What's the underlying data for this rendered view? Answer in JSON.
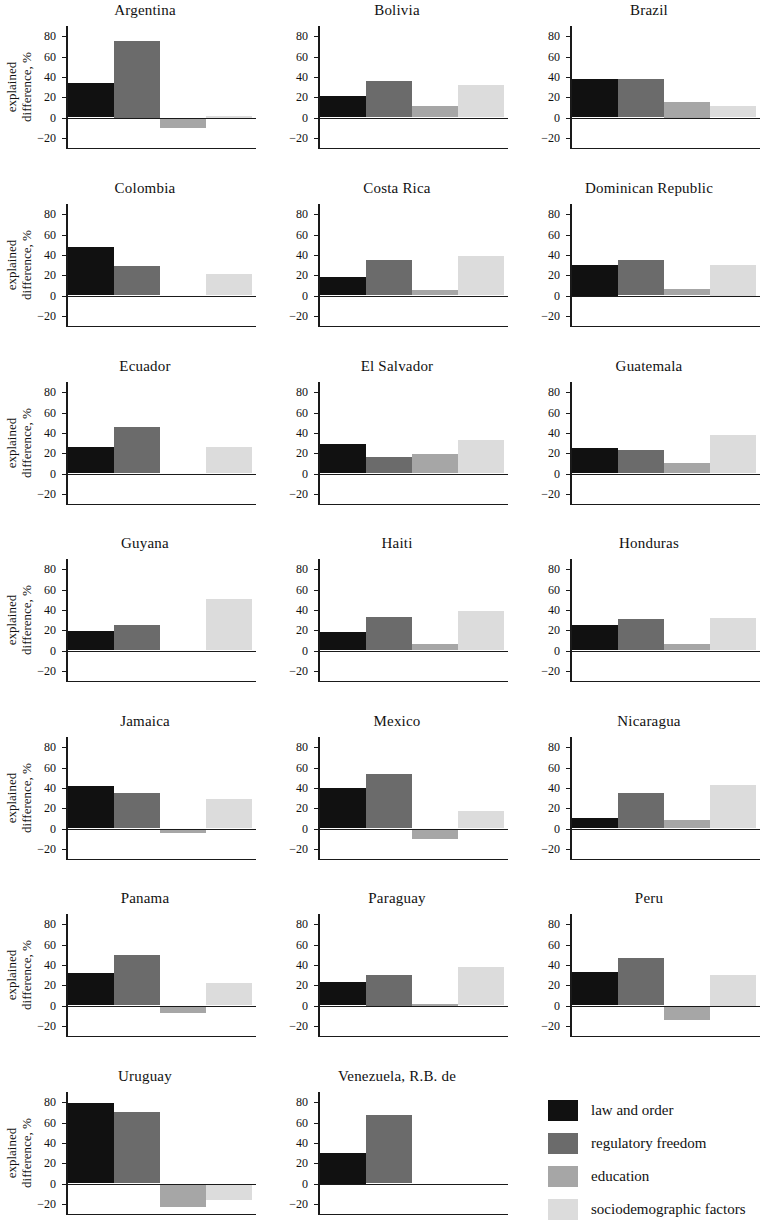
{
  "axis": {
    "ylabel_line1": "explained",
    "ylabel_line2": "difference, %",
    "ticks": [
      "80",
      "60",
      "40",
      "20",
      "0",
      "−20"
    ],
    "tick_values": [
      80,
      60,
      40,
      20,
      0,
      -20
    ],
    "ymin": -30,
    "ymax": 90
  },
  "legend": {
    "items": [
      {
        "label": "law and order",
        "color": "#111111"
      },
      {
        "label": "regulatory freedom",
        "color": "#6b6b6b"
      },
      {
        "label": "education",
        "color": "#a6a6a6"
      },
      {
        "label": "sociodemographic factors",
        "color": "#dcdcdc"
      }
    ]
  },
  "chart_data": {
    "type": "bar",
    "title": "",
    "xlabel": "",
    "ylabel": "explained difference, %",
    "ylim": [
      -30,
      90
    ],
    "yticks": [
      -20,
      0,
      20,
      40,
      60,
      80
    ],
    "grid": false,
    "legend_position": "bottom-right",
    "categories": [
      "law and order",
      "regulatory freedom",
      "education",
      "sociodemographic factors"
    ],
    "colors": [
      "#111111",
      "#6b6b6b",
      "#a6a6a6",
      "#dcdcdc"
    ],
    "panels": [
      {
        "name": "Argentina",
        "values": [
          34,
          75,
          -10,
          1
        ]
      },
      {
        "name": "Bolivia",
        "values": [
          21,
          36,
          11,
          32
        ]
      },
      {
        "name": "Brazil",
        "values": [
          38,
          38,
          15,
          11
        ]
      },
      {
        "name": "Colombia",
        "values": [
          48,
          29,
          0,
          21
        ]
      },
      {
        "name": "Costa Rica",
        "values": [
          18,
          35,
          5,
          39
        ]
      },
      {
        "name": "Dominican Republic",
        "values": [
          30,
          35,
          6,
          30
        ]
      },
      {
        "name": "Ecuador",
        "values": [
          26,
          46,
          0,
          26
        ]
      },
      {
        "name": "El Salvador",
        "values": [
          29,
          16,
          19,
          33
        ]
      },
      {
        "name": "Guatemala",
        "values": [
          25,
          23,
          10,
          38
        ]
      },
      {
        "name": "Guyana",
        "values": [
          19,
          25,
          0,
          51
        ]
      },
      {
        "name": "Haiti",
        "values": [
          18,
          33,
          6,
          39
        ]
      },
      {
        "name": "Honduras",
        "values": [
          25,
          31,
          6,
          32
        ]
      },
      {
        "name": "Jamaica",
        "values": [
          42,
          35,
          -4,
          29
        ]
      },
      {
        "name": "Mexico",
        "values": [
          40,
          54,
          -10,
          17
        ]
      },
      {
        "name": "Nicaragua",
        "values": [
          10,
          35,
          8,
          43
        ]
      },
      {
        "name": "Panama",
        "values": [
          32,
          50,
          -7,
          22
        ]
      },
      {
        "name": "Paraguay",
        "values": [
          23,
          30,
          1,
          38
        ]
      },
      {
        "name": "Peru",
        "values": [
          33,
          47,
          -14,
          30
        ]
      },
      {
        "name": "Uruguay",
        "values": [
          79,
          70,
          -23,
          -16
        ]
      },
      {
        "name": "Venezuela, R.B. de",
        "values": [
          30,
          67,
          -1,
          -1
        ]
      }
    ]
  }
}
